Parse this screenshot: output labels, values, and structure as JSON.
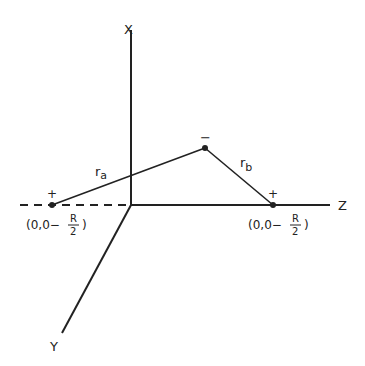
{
  "axes": {
    "x_label": "X",
    "y_label": "Y",
    "z_label": "Z"
  },
  "charges": {
    "left_sign": "+",
    "right_sign": "+",
    "electron_sign": "−"
  },
  "distances": {
    "ra_main": "r",
    "ra_sub": "a",
    "rb_main": "r",
    "rb_sub": "b"
  },
  "coordinates": {
    "left_prefix": "(0,0−",
    "left_num": "R",
    "left_den": "2",
    "left_suffix": ")",
    "right_prefix": "(0,0−",
    "right_num": "R",
    "right_den": "2",
    "right_suffix": ")"
  }
}
